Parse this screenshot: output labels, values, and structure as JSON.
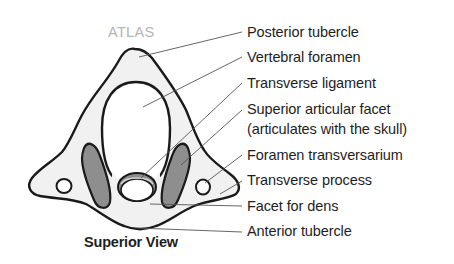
{
  "diagram": {
    "title": "ATLAS",
    "caption": "Superior View",
    "colors": {
      "bone_fill": "#f1f1f1",
      "outline": "#1a1a1a",
      "facet_fill": "#8e8e8e",
      "leader_line": "#555555",
      "title_color": "#b4b4b4",
      "label_color": "#1e1e1e"
    },
    "labels": [
      {
        "id": "posterior-tubercle",
        "text": "Posterior tubercle"
      },
      {
        "id": "vertebral-foramen",
        "text": "Vertebral foramen"
      },
      {
        "id": "transverse-ligament",
        "text": "Transverse ligament"
      },
      {
        "id": "superior-articular-facet",
        "text": "Superior articular facet"
      },
      {
        "id": "superior-articular-facet-note",
        "text": "(articulates with the skull)"
      },
      {
        "id": "foramen-transversarium",
        "text": "Foramen transversarium"
      },
      {
        "id": "transverse-process",
        "text": "Transverse process"
      },
      {
        "id": "facet-for-dens",
        "text": "Facet for dens"
      },
      {
        "id": "anterior-tubercle",
        "text": "Anterior tubercle"
      }
    ]
  }
}
